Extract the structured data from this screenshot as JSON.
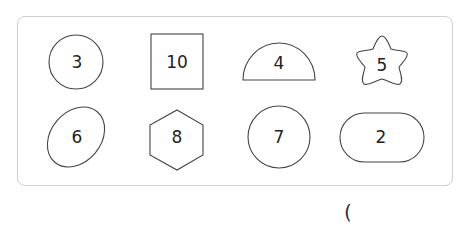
{
  "panel": {
    "shapes": [
      {
        "shape": "circle",
        "label": "3"
      },
      {
        "shape": "square",
        "label": "10"
      },
      {
        "shape": "semicircle",
        "label": "4"
      },
      {
        "shape": "star",
        "label": "5"
      },
      {
        "shape": "ellipse",
        "label": "6"
      },
      {
        "shape": "hexagon",
        "label": "8"
      },
      {
        "shape": "circle",
        "label": "7"
      },
      {
        "shape": "stadium",
        "label": "2"
      }
    ]
  },
  "answer_blank": {
    "text": "("
  },
  "colors": {
    "stroke": "#444444",
    "panel_border": "#cfcfcf"
  }
}
